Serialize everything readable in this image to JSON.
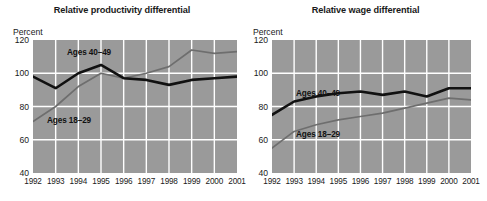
{
  "chart_data": [
    {
      "type": "line",
      "title": "Relative productivity differential",
      "ylabel": "Percent",
      "xlabel": "",
      "ylim": [
        40,
        120
      ],
      "yticks": [
        120,
        100,
        80,
        60,
        40
      ],
      "grid": true,
      "legend_position": "inline-annotation",
      "categories": [
        "1992",
        "1993",
        "1994",
        "1995",
        "1996",
        "1997",
        "1998",
        "1999",
        "2000",
        "2001"
      ],
      "series": [
        {
          "name": "Ages 40–49",
          "color": "#111111",
          "values": [
            98,
            91,
            100,
            105,
            97,
            96,
            93,
            96,
            97,
            98
          ]
        },
        {
          "name": "Ages 18–29",
          "color": "#6e6e6e",
          "values": [
            71,
            80,
            92,
            100,
            97,
            100,
            104,
            114,
            112,
            113
          ]
        }
      ]
    },
    {
      "type": "line",
      "title": "Relative wage differential",
      "ylabel": "Percent",
      "xlabel": "",
      "ylim": [
        40,
        120
      ],
      "yticks": [
        120,
        100,
        80,
        60,
        40
      ],
      "grid": true,
      "legend_position": "inline-annotation",
      "categories": [
        "1992",
        "1993",
        "1994",
        "1995",
        "1996",
        "1997",
        "1998",
        "1999",
        "2000",
        "2001"
      ],
      "series": [
        {
          "name": "Ages 40–49",
          "color": "#111111",
          "values": [
            75,
            83,
            86,
            88,
            89,
            87,
            89,
            86,
            91,
            91
          ]
        },
        {
          "name": "Ages 18–29",
          "color": "#6e6e6e",
          "values": [
            55,
            65,
            69,
            72,
            74,
            76,
            79,
            82,
            85,
            84
          ]
        }
      ]
    }
  ],
  "left_panel": {
    "title": "Relative productivity differential",
    "unit": "Percent",
    "yticks": [
      "120",
      "100",
      "80",
      "60",
      "40"
    ],
    "xticks": [
      "1992",
      "1993",
      "1994",
      "1995",
      "1996",
      "1997",
      "1998",
      "1999",
      "2000",
      "2001"
    ],
    "label_older": "Ages 40–49",
    "label_younger": "Ages 18–29"
  },
  "right_panel": {
    "title": "Relative wage differential",
    "unit": "Percent",
    "yticks": [
      "120",
      "100",
      "80",
      "60",
      "40"
    ],
    "xticks": [
      "1992",
      "1993",
      "1994",
      "1995",
      "1996",
      "1997",
      "1998",
      "1999",
      "2000",
      "2001"
    ],
    "label_older": "Ages 40–49",
    "label_younger": "Ages 18–29"
  },
  "colors": {
    "plot_background": "#9a9a9a",
    "gridline": "#ffffff",
    "series_older": "#111111",
    "series_younger": "#6e6e6e",
    "text": "#1a1a1a"
  }
}
